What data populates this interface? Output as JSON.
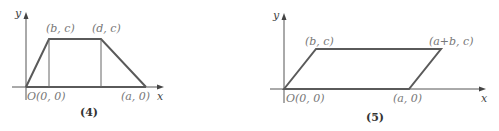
{
  "figures": [
    {
      "id": "4",
      "caption": "(4)",
      "shape": "trapezoid",
      "axis_labels": {
        "x": "x",
        "y": "y"
      },
      "points": {
        "origin": "O(0, 0)",
        "top_left": "(b, c)",
        "top_right": "(d, c)",
        "bottom_right": "(a, 0)"
      }
    },
    {
      "id": "5",
      "caption": "(5)",
      "shape": "parallelogram",
      "axis_labels": {
        "x": "x",
        "y": "y"
      },
      "points": {
        "origin": "O(0, 0)",
        "top_left": "(b, c)",
        "top_right": "(a+b, c)",
        "bottom_right": "(a, 0)"
      }
    }
  ]
}
